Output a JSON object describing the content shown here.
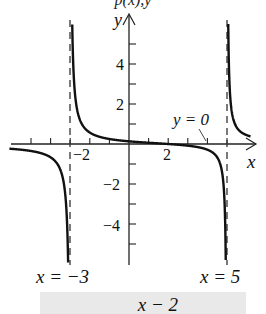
{
  "top_text": "p(x),y",
  "chart_data": {
    "type": "line",
    "function": "y = (x - 2) / ((x + 3)(x - 5))",
    "title": "",
    "xlabel": "x",
    "ylabel": "y",
    "xlim": [
      -6,
      6.5
    ],
    "ylim": [
      -6,
      6.5
    ],
    "x_ticks": [
      -5,
      -4,
      -3,
      -2,
      -1,
      0,
      1,
      2,
      3,
      4,
      5
    ],
    "x_tick_labels": {
      "-2": "−2",
      "2": "2"
    },
    "y_ticks": [
      -5,
      -4,
      -3,
      -2,
      -1,
      1,
      2,
      3,
      4,
      5
    ],
    "y_tick_labels": {
      "4": "4",
      "2": "2",
      "-2": "−2",
      "-4": "−4"
    },
    "vertical_asymptotes": [
      -3,
      5
    ],
    "horizontal_asymptote": 0,
    "annotations": [
      {
        "text": "x = −3",
        "at": "vertical asymptote x=-3, below graph"
      },
      {
        "text": "x = 5",
        "at": "vertical asymptote x=5, below graph"
      },
      {
        "text": "y = 0",
        "at": "horizontal asymptote, pointer near x≈4"
      }
    ],
    "grid": false,
    "legend": "none"
  },
  "labels": {
    "y_axis": "y",
    "x_axis": "x",
    "tick_4": "4",
    "tick_2": "2",
    "tick_neg2_y": "−2",
    "tick_neg4_y": "−4",
    "tick_neg2_x": "−2",
    "tick_2_x": "2",
    "asym_left": "x = −3",
    "asym_right": "x = 5",
    "asym_h": "y = 0"
  },
  "bottom_text": "x − 2"
}
